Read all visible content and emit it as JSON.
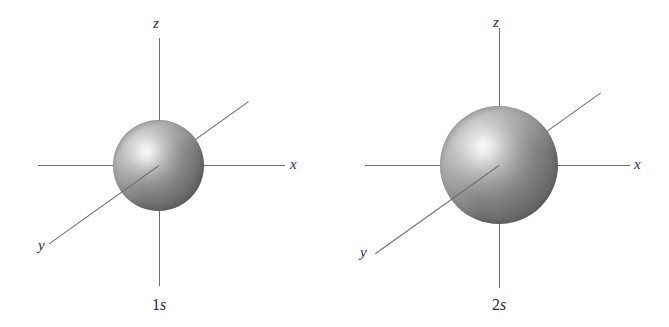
{
  "figure": {
    "type": "orbital-diagram",
    "background_color": "#ffffff",
    "axis_line_color": "#6f6f6f",
    "label_color": "#2e2e2e",
    "sphere_highlight_color": "#fdfdfd",
    "sphere_edge_color": "#575757",
    "orbitals": [
      {
        "id": "1s",
        "caption_n": "1",
        "caption_letter": "s",
        "axis_labels": {
          "z": "z",
          "x": "x",
          "y": "y"
        },
        "sphere_diameter_px": 91
      },
      {
        "id": "2s",
        "caption_n": "2",
        "caption_letter": "s",
        "axis_labels": {
          "z": "z",
          "x": "x",
          "y": "y"
        },
        "sphere_diameter_px": 118
      }
    ]
  }
}
